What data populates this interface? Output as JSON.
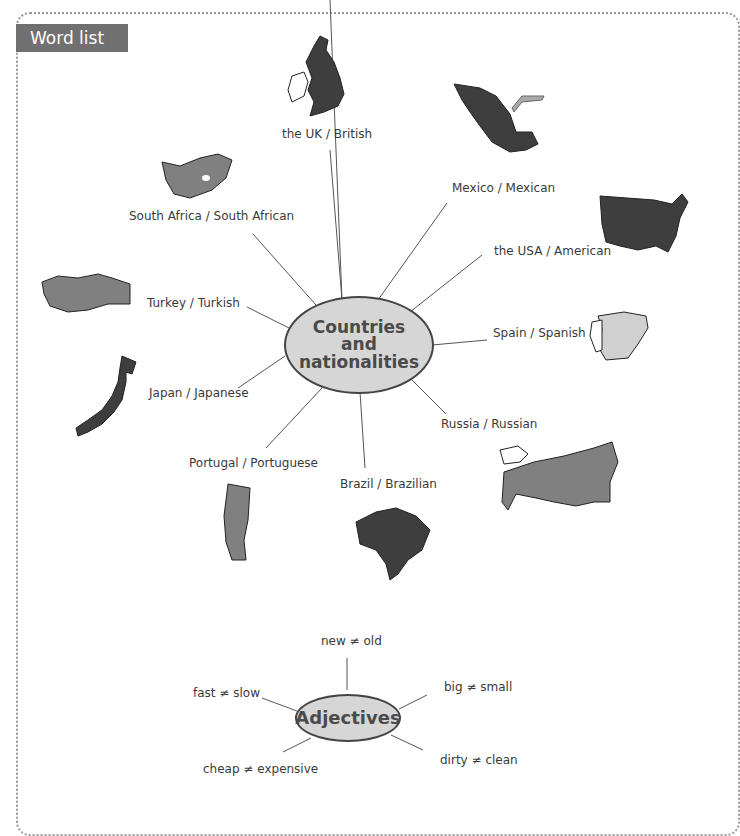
{
  "page": {
    "header_cutoff": "VOCABULARY",
    "heading": "Word list"
  },
  "countries_map": {
    "hub_label_lines": [
      "Countries",
      "and",
      "nationalities"
    ],
    "items": [
      {
        "label": "the UK / British",
        "map_icon": "uk-map-icon"
      },
      {
        "label": "Mexico / Mexican",
        "map_icon": "mexico-map-icon"
      },
      {
        "label": "South Africa / South African",
        "map_icon": "south-africa-map-icon"
      },
      {
        "label": "the USA / American",
        "map_icon": "usa-map-icon"
      },
      {
        "label": "Turkey / Turkish",
        "map_icon": "turkey-map-icon"
      },
      {
        "label": "Spain / Spanish",
        "map_icon": "spain-map-icon"
      },
      {
        "label": "Japan / Japanese",
        "map_icon": "japan-map-icon"
      },
      {
        "label": "Russia / Russian",
        "map_icon": "russia-map-icon"
      },
      {
        "label": "Portugal / Portuguese",
        "map_icon": "portugal-map-icon"
      },
      {
        "label": "Brazil / Brazilian",
        "map_icon": "brazil-map-icon"
      }
    ]
  },
  "adjectives_map": {
    "hub_label": "Adjectives",
    "items": [
      {
        "label": "new ≠ old"
      },
      {
        "label": "big ≠ small"
      },
      {
        "label": "fast ≠ slow"
      },
      {
        "label": "dirty ≠ clean"
      },
      {
        "label": "cheap ≠ expensive"
      }
    ]
  },
  "colors": {
    "heading_bg": "#707070",
    "hub_fill": "#d6d6d6",
    "map_dark": "#3e3e3e",
    "map_mid": "#808080",
    "map_light": "#d0d0d0"
  }
}
